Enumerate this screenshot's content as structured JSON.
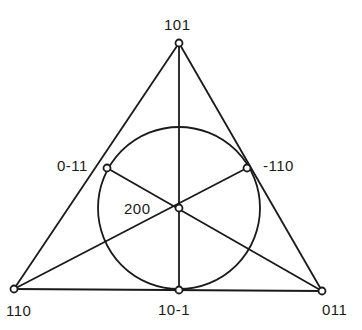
{
  "diagram": {
    "type": "fano-plane",
    "colors": {
      "stroke": "#1a1a1a",
      "background": "#ffffff"
    },
    "nodes": [
      {
        "id": "top",
        "label": "101",
        "x": 179,
        "y": 43
      },
      {
        "id": "bottom-left",
        "label": "110",
        "x": 14,
        "y": 289
      },
      {
        "id": "bottom-right",
        "label": "011",
        "x": 322,
        "y": 291
      },
      {
        "id": "left-mid",
        "label": "0-11",
        "x": 107,
        "y": 168
      },
      {
        "id": "right-mid",
        "label": "-110",
        "x": 247,
        "y": 168
      },
      {
        "id": "bottom-mid",
        "label": "10-1",
        "x": 179,
        "y": 290
      },
      {
        "id": "center",
        "label": "200",
        "x": 179,
        "y": 208
      }
    ],
    "circle": {
      "cx": 179,
      "cy": 208,
      "r": 81
    }
  }
}
